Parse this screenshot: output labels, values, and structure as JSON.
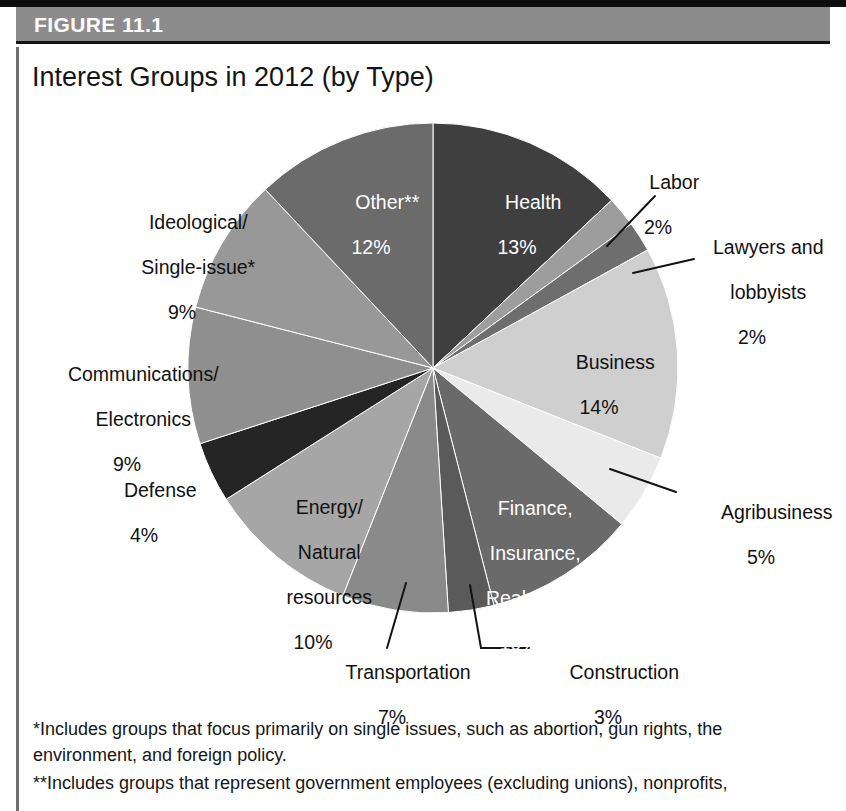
{
  "figure": {
    "label": "FIGURE 11.1",
    "title": "Interest Groups in 2012 (by Type)"
  },
  "colors": {
    "header_bar": "#8c8c8c",
    "header_text": "#ffffff",
    "top_rule": "#0d0d0d",
    "text": "#111111",
    "background": "#ffffff"
  },
  "chart_data": {
    "type": "pie",
    "title": "Interest Groups in 2012 (by Type)",
    "xlabel": "",
    "ylabel": "",
    "units": "percent",
    "start_angle_deg": 0,
    "direction": "clockwise",
    "legend": "none (labels placed on/around slices)",
    "categories": [
      "Health",
      "Labor",
      "Lawyers and lobbyists",
      "Business",
      "Agribusiness",
      "Finance, Insurance, Real estate",
      "Construction",
      "Transportation",
      "Energy/Natural resources",
      "Defense",
      "Communications/Electronics",
      "Ideological/Single-issue*",
      "Other**"
    ],
    "values": [
      13,
      2,
      2,
      14,
      5,
      10,
      3,
      7,
      10,
      4,
      9,
      9,
      12
    ],
    "slice_colors": [
      "#3f3f3f",
      "#9d9d9d",
      "#6e6e6e",
      "#cfcfcf",
      "#eaeaea",
      "#6a6a6a",
      "#5a5a5a",
      "#8a8a8a",
      "#a6a6a6",
      "#252525",
      "#8f8f8f",
      "#989898",
      "#6b6b6b"
    ],
    "label_text_colors": [
      "#ffffff",
      "#111111",
      "#111111",
      "#111111",
      "#111111",
      "#ffffff",
      "#111111",
      "#111111",
      "#111111",
      "#111111",
      "#111111",
      "#111111",
      "#ffffff"
    ]
  },
  "slices": [
    {
      "name": "Health",
      "pct": "13%",
      "line1": "Health",
      "line2": "",
      "line3": "",
      "value": 13
    },
    {
      "name": "Labor",
      "pct": "2%",
      "line1": "Labor",
      "line2": "",
      "line3": "",
      "value": 2
    },
    {
      "name": "Lawyers and lobbyists",
      "pct": "2%",
      "line1": "Lawyers and",
      "line2": "lobbyists",
      "line3": "",
      "value": 2
    },
    {
      "name": "Business",
      "pct": "14%",
      "line1": "Business",
      "line2": "",
      "line3": "",
      "value": 14
    },
    {
      "name": "Agribusiness",
      "pct": "5%",
      "line1": "Agribusiness",
      "line2": "",
      "line3": "",
      "value": 5
    },
    {
      "name": "Finance, Insurance, Real estate",
      "pct": "10%",
      "line1": "Finance,",
      "line2": "Insurance,",
      "line3": "Real estate",
      "value": 10
    },
    {
      "name": "Construction",
      "pct": "3%",
      "line1": "Construction",
      "line2": "",
      "line3": "",
      "value": 3
    },
    {
      "name": "Transportation",
      "pct": "7%",
      "line1": "Transportation",
      "line2": "",
      "line3": "",
      "value": 7
    },
    {
      "name": "Energy/Natural resources",
      "pct": "10%",
      "line1": "Energy/",
      "line2": "Natural",
      "line3": "resources",
      "value": 10
    },
    {
      "name": "Defense",
      "pct": "4%",
      "line1": "Defense",
      "line2": "",
      "line3": "",
      "value": 4
    },
    {
      "name": "Communications/Electronics",
      "pct": "9%",
      "line1": "Communications/",
      "line2": "Electronics",
      "line3": "",
      "value": 9
    },
    {
      "name": "Ideological/Single-issue*",
      "pct": "9%",
      "line1": "Ideological/",
      "line2": "Single-issue*",
      "line3": "",
      "value": 9
    },
    {
      "name": "Other**",
      "pct": "12%",
      "line1": "Other**",
      "line2": "",
      "line3": "",
      "value": 12
    }
  ],
  "footnotes": {
    "single_issue": "*Includes groups that focus primarily on single issues, such as abortion, gun rights, the environment, and foreign policy.",
    "other": "**Includes groups that represent government employees (excluding unions), nonprofits,"
  }
}
